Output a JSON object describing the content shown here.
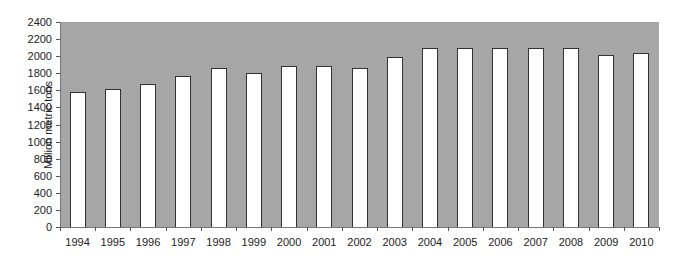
{
  "chart_data": {
    "type": "bar",
    "title": "",
    "xlabel": "",
    "ylabel": "Million metric tons",
    "ylim": [
      0,
      2400
    ],
    "yticks": [
      0,
      200,
      400,
      600,
      800,
      1000,
      1200,
      1400,
      1600,
      1800,
      2000,
      2200,
      2400
    ],
    "grid": false,
    "legend": null,
    "categories": [
      "1994",
      "1995",
      "1996",
      "1997",
      "1998",
      "1999",
      "2000",
      "2001",
      "2002",
      "2003",
      "2004",
      "2005",
      "2006",
      "2007",
      "2008",
      "2009",
      "2010"
    ],
    "values": [
      1580,
      1620,
      1680,
      1770,
      1860,
      1800,
      1890,
      1880,
      1860,
      1990,
      2090,
      2100,
      2100,
      2100,
      2100,
      2010,
      2040
    ],
    "colors": {
      "plot_background": "#a6a6a6",
      "bar_fill": "#ffffff",
      "bar_border": "#333333"
    }
  }
}
